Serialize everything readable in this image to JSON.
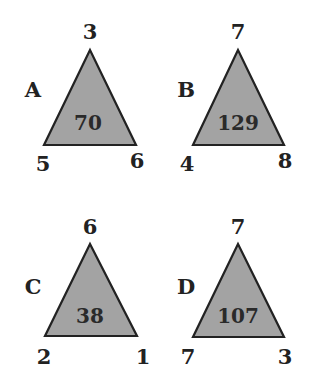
{
  "puzzle": {
    "fill_color": "#a3a3a3",
    "stroke_color": "#222222",
    "triangles": [
      {
        "label": "A",
        "top": "3",
        "bottom_left": "5",
        "bottom_right": "6",
        "center": "70"
      },
      {
        "label": "B",
        "top": "7",
        "bottom_left": "4",
        "bottom_right": "8",
        "center": "129"
      },
      {
        "label": "C",
        "top": "6",
        "bottom_left": "2",
        "bottom_right": "1",
        "center": "38"
      },
      {
        "label": "D",
        "top": "7",
        "bottom_left": "7",
        "bottom_right": "3",
        "center": "107"
      }
    ]
  }
}
